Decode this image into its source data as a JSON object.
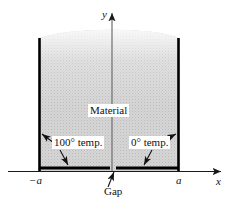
{
  "figure": {
    "colors": {
      "material_fill": "#d0d0d0",
      "edge": "#000000",
      "axis": "#1a1a1a",
      "label_text": "#111111",
      "background": "#ffffff"
    },
    "labels": {
      "material": "Material",
      "temp_left": "100° temp.",
      "temp_right": "0° temp.",
      "gap": "Gap",
      "x_axis": "x",
      "y_axis": "y",
      "tick_left": "−a",
      "tick_right": "a"
    },
    "geometry": {
      "x_axis_y": 171,
      "y_axis_x": 112,
      "left_wall_x": 39,
      "right_wall_x": 179,
      "top_curve_peak_y": 28,
      "top_curve_edge_y": 38,
      "gap_center_x": 113,
      "gap_width": 6,
      "x_arrow_tip_x": 223,
      "y_arrow_tip_y": 10
    },
    "annotations": {
      "arrow_100_to_left_wall": "arrow pointing up-left to the left vertical boundary",
      "arrow_100_to_bottom": "arrow pointing down-right to the bottom boundary",
      "arrow_0_to_right_wall": "arrow pointing up-right to the right vertical boundary",
      "arrow_0_to_bottom": "arrow pointing down-left to the bottom boundary",
      "arrow_gap": "arrow pointing up to the gap in the bottom boundary"
    }
  }
}
